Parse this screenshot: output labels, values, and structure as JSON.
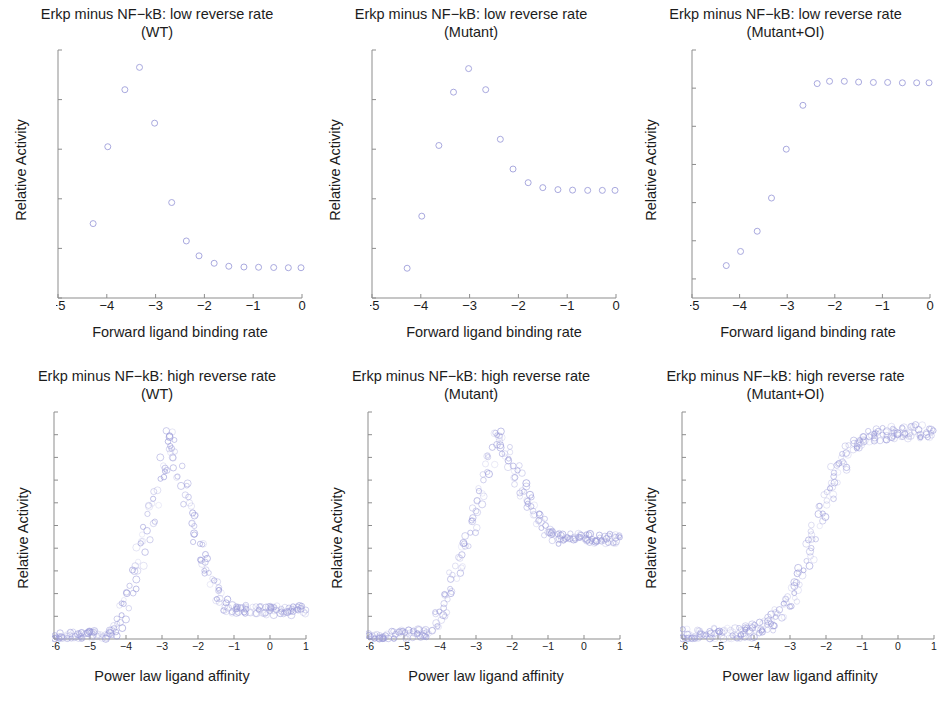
{
  "figure": {
    "width": 943,
    "height": 711,
    "background": "#ffffff",
    "marker_color": "#9a9ad8",
    "marker_color_faint": "#c9c9ea",
    "axis_color": "#8d8d8d",
    "text_color": "#1c1c1c"
  },
  "chart_data": [
    {
      "type": "scatter",
      "id": "low-reverse-wt",
      "title": "Erkp minus NF−kB: low reverse rate\n(WT)",
      "title_line1": "Erkp minus NF−kB: low reverse rate",
      "title_line2": "(WT)",
      "xlabel": "Forward ligand binding rate",
      "ylabel": "Relative Activity",
      "xlim": [
        -5,
        0
      ],
      "ylim": [
        0,
        1
      ],
      "xticks": [
        -5,
        -4,
        -3,
        -2,
        -1,
        0
      ],
      "xticklabels": [
        "−5",
        "−4",
        "−3",
        "−2",
        "−1",
        "0"
      ],
      "yticks": [
        0,
        0.2,
        0.4,
        0.6,
        0.8,
        1
      ],
      "yticklabels": [
        "0",
        "0.2",
        "0.4",
        "0.6",
        "0.8",
        "1"
      ],
      "grid": false,
      "legend": "none",
      "x": [
        -4.28,
        -3.98,
        -3.63,
        -3.33,
        -3.02,
        -2.67,
        -2.37,
        -2.11,
        -1.8,
        -1.5,
        -1.19,
        -0.89,
        -0.58,
        -0.28,
        -0.02
      ],
      "y": [
        0.3,
        0.61,
        0.84,
        0.93,
        0.705,
        0.385,
        0.23,
        0.17,
        0.14,
        0.128,
        0.125,
        0.124,
        0.123,
        0.122,
        0.122
      ]
    },
    {
      "type": "scatter",
      "id": "low-reverse-mutant",
      "title": "Erkp minus NF−kB: low reverse rate\n(Mutant)",
      "title_line1": "Erkp minus NF−kB: low reverse rate",
      "title_line2": "(Mutant)",
      "xlabel": "Forward ligand binding rate",
      "ylabel": "Relative Activity",
      "xlim": [
        -5,
        0
      ],
      "ylim": [
        0,
        1
      ],
      "xticks": [
        -5,
        -4,
        -3,
        -2,
        -1,
        0
      ],
      "xticklabels": [
        "−5",
        "−4",
        "−3",
        "−2",
        "−1",
        "0"
      ],
      "yticks": [
        0,
        0.2,
        0.4,
        0.6,
        0.8,
        1
      ],
      "yticklabels": [
        "0",
        "0.2",
        "0.4",
        "0.6",
        "0.8",
        "1"
      ],
      "grid": false,
      "legend": "none",
      "x": [
        -4.28,
        -3.98,
        -3.63,
        -3.33,
        -3.02,
        -2.67,
        -2.37,
        -2.11,
        -1.8,
        -1.5,
        -1.19,
        -0.89,
        -0.58,
        -0.28,
        -0.02
      ],
      "y": [
        0.12,
        0.33,
        0.615,
        0.83,
        0.925,
        0.84,
        0.64,
        0.52,
        0.465,
        0.445,
        0.437,
        0.435,
        0.434,
        0.434,
        0.434
      ]
    },
    {
      "type": "scatter",
      "id": "low-reverse-mutant-oi",
      "title": "Erkp minus NF−kB: low reverse rate\n(Mutant+OI)",
      "title_line1": "Erkp minus NF−kB: low reverse rate",
      "title_line2": "(Mutant+OI)",
      "xlabel": "Forward ligand binding rate",
      "ylabel": "Relative Activity",
      "xlim": [
        -5,
        0
      ],
      "ylim": [
        0.35,
        1
      ],
      "xticks": [
        -5,
        -4,
        -3,
        -2,
        -1,
        0
      ],
      "xticklabels": [
        "−5",
        "−4",
        "−3",
        "−2",
        "−1",
        "0"
      ],
      "yticks": [
        0.4,
        0.5,
        0.6,
        0.7,
        0.8,
        0.9,
        1
      ],
      "yticklabels": [
        "0.4",
        "0.5",
        "0.6",
        "0.7",
        "0.8",
        "0.9",
        "1"
      ],
      "grid": false,
      "legend": "none",
      "x": [
        -4.28,
        -3.98,
        -3.63,
        -3.33,
        -3.02,
        -2.67,
        -2.37,
        -2.11,
        -1.8,
        -1.5,
        -1.19,
        -0.89,
        -0.58,
        -0.28,
        -0.02
      ],
      "y": [
        0.435,
        0.472,
        0.525,
        0.612,
        0.74,
        0.855,
        0.912,
        0.918,
        0.918,
        0.916,
        0.915,
        0.915,
        0.914,
        0.914,
        0.914
      ]
    },
    {
      "type": "scatter",
      "id": "high-reverse-wt",
      "title": "Erkp minus NF−kB: high reverse rate\n(WT)",
      "title_line1": "Erkp minus NF−kB: high reverse rate",
      "title_line2": "(WT)",
      "xlabel": "Power law ligand affinity",
      "ylabel": "Relative Activity",
      "xlim": [
        -6,
        1
      ],
      "ylim": [
        0,
        1
      ],
      "xticks": [
        -6,
        -5,
        -4,
        -3,
        -2,
        -1,
        0,
        1
      ],
      "xticklabels": [
        "−6",
        "−5",
        "−4",
        "−3",
        "−2",
        "−1",
        "0",
        "1"
      ],
      "yticks": [
        0,
        0.1,
        0.2,
        0.3,
        0.4,
        0.5,
        0.6,
        0.7,
        0.8,
        0.9,
        1
      ],
      "yticklabels": [
        "0",
        "0.1",
        "0.2",
        "0.3",
        "0.4",
        "0.5",
        "0.6",
        "0.7",
        "0.8",
        "0.9",
        "1"
      ],
      "grid": false,
      "legend": "none",
      "cloud": {
        "n": 260,
        "peak_x": -2.75,
        "peak_y": 0.91,
        "rise_start_x": -4.6,
        "tail_y": 0.125,
        "tail_start_x": -1.1,
        "baseline_x_end": -4.35,
        "jitter_x": 0.16,
        "jitter_y": 0.022
      }
    },
    {
      "type": "scatter",
      "id": "high-reverse-mutant",
      "title": "Erkp minus NF−kB: high reverse rate\n(Mutant)",
      "title_line1": "Erkp minus NF−kB: high reverse rate",
      "title_line2": "(Mutant)",
      "xlabel": "Power law ligand affinity",
      "ylabel": "Relative Activity",
      "xlim": [
        -6,
        1
      ],
      "ylim": [
        0,
        1
      ],
      "xticks": [
        -6,
        -5,
        -4,
        -3,
        -2,
        -1,
        0,
        1
      ],
      "xticklabels": [
        "−6",
        "−5",
        "−4",
        "−3",
        "−2",
        "−1",
        "0",
        "1"
      ],
      "yticks": [
        0,
        0.1,
        0.2,
        0.3,
        0.4,
        0.5,
        0.6,
        0.7,
        0.8,
        0.9,
        1
      ],
      "yticklabels": [
        "0",
        "0.1",
        "0.2",
        "0.3",
        "0.4",
        "0.5",
        "0.6",
        "0.7",
        "0.8",
        "0.9",
        "1"
      ],
      "grid": false,
      "legend": "none",
      "cloud": {
        "n": 260,
        "peak_x": -2.35,
        "peak_y": 0.92,
        "rise_start_x": -4.45,
        "tail_y": 0.44,
        "tail_start_x": -0.7,
        "baseline_x_end": -4.3,
        "jitter_x": 0.16,
        "jitter_y": 0.022
      }
    },
    {
      "type": "scatter",
      "id": "high-reverse-mutant-oi",
      "title": "Erkp minus NF−kB: high reverse rate\n(Mutant+OI)",
      "title_line1": "Erkp minus NF−kB: high reverse rate",
      "title_line2": "(Mutant+OI)",
      "xlabel": "Power law ligand affinity",
      "ylabel": "Relative Activity",
      "xlim": [
        -6,
        1
      ],
      "ylim": [
        0,
        1
      ],
      "xticks": [
        -6,
        -5,
        -4,
        -3,
        -2,
        -1,
        0,
        1
      ],
      "xticklabels": [
        "−6",
        "−5",
        "−4",
        "−3",
        "−2",
        "−1",
        "0",
        "1"
      ],
      "yticks": [
        0,
        0.1,
        0.2,
        0.3,
        0.4,
        0.5,
        0.6,
        0.7,
        0.8,
        0.9,
        1
      ],
      "yticklabels": [
        "0",
        "0.1",
        "0.2",
        "0.3",
        "0.4",
        "0.5",
        "0.6",
        "0.7",
        "0.8",
        "0.9",
        "1"
      ],
      "grid": false,
      "legend": "none",
      "sigmoid": {
        "n": 260,
        "plateau_y": 0.915,
        "midpoint_x": -2.3,
        "steepness": 2.3,
        "low_y": 0.02,
        "jitter_x": 0.18,
        "jitter_y": 0.03
      }
    }
  ]
}
